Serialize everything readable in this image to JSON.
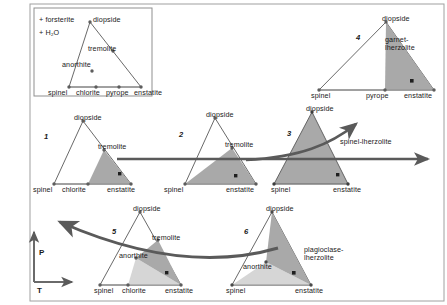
{
  "figure": {
    "title_note": "Phase relations for lherzolite assemblages",
    "background_color": "#ffffff",
    "frame_color": "#9a9a9a",
    "line_color": "#555555",
    "arrow_color": "#5a5a5a",
    "shade_dark": "#a8a8a8",
    "shade_light": "#d4d4d4",
    "point_color": "#6b6b6b"
  },
  "inset": {
    "name": "legend-inset",
    "conditions": [
      "+ forsterite",
      "+ H₂O"
    ],
    "apex_label": "diopside",
    "edge_label": "tremolite",
    "interior_label": "anorthite",
    "base_labels": [
      "spinel",
      "chlorite",
      "pyrope",
      "enstatite"
    ]
  },
  "axes": {
    "pressure": "P",
    "temperature": "T"
  },
  "triangles": [
    {
      "id": 1,
      "number": "1",
      "apex": "diopside",
      "left_base": "spinel",
      "right_base": "enstatite",
      "mid_base": "chlorite",
      "edge_label": "tremolite",
      "interior_label": "",
      "field_label": ""
    },
    {
      "id": 2,
      "number": "2",
      "apex": "diopside",
      "left_base": "spinel",
      "right_base": "enstatite",
      "mid_base": "",
      "edge_label": "tremolite",
      "interior_label": "",
      "field_label": ""
    },
    {
      "id": 3,
      "number": "3",
      "apex": "diopside",
      "left_base": "spinel",
      "right_base": "enstatite",
      "mid_base": "",
      "edge_label": "",
      "interior_label": "",
      "field_label": "spinel-lherzolite"
    },
    {
      "id": 4,
      "number": "4",
      "apex": "diopside",
      "left_base": "spinel",
      "right_base": "enstatite",
      "mid_base": "pyrope",
      "edge_label": "",
      "interior_label": "",
      "field_label_line1": "garnet-",
      "field_label_line2": "lherzolite"
    },
    {
      "id": 5,
      "number": "5",
      "apex": "diopside",
      "left_base": "spinel",
      "right_base": "enstatite",
      "mid_base": "chlorite",
      "edge_label": "tremolite",
      "interior_label": "anorthite",
      "field_label": ""
    },
    {
      "id": 6,
      "number": "6",
      "apex": "diopside",
      "left_base": "spinel",
      "right_base": "enstatite",
      "mid_base": "",
      "edge_label": "",
      "interior_label": "anorthite",
      "field_label_line1": "plagioclase-",
      "field_label_line2": "lherzolite"
    }
  ]
}
